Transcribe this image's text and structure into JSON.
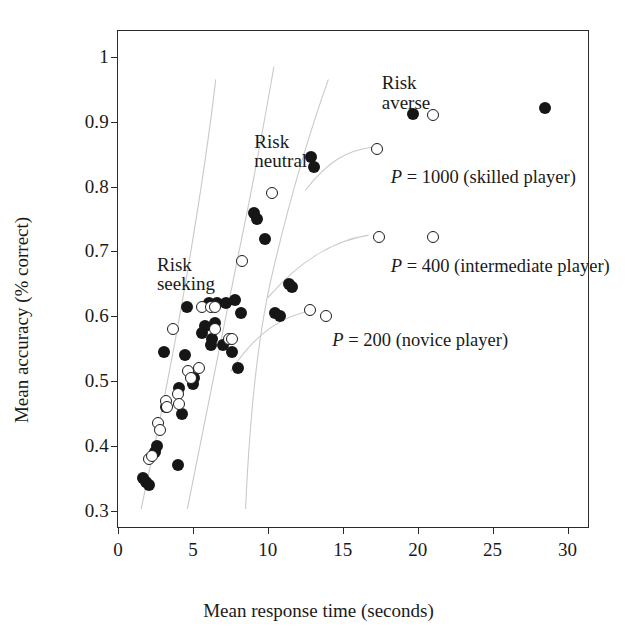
{
  "chart_data": {
    "type": "scatter",
    "title": "",
    "xlabel": "Mean response time (seconds)",
    "ylabel": "Mean accuracy (% correct)",
    "xlim": [
      0,
      31.5
    ],
    "ylim": [
      0.272,
      1.04
    ],
    "xticks": [
      0,
      5,
      10,
      15,
      20,
      25,
      30
    ],
    "xticklabels": [
      "0",
      "5",
      "10",
      "15",
      "20",
      "25",
      "30"
    ],
    "yticks": [
      0.3,
      0.4,
      0.5,
      0.6,
      0.7,
      0.8,
      0.9,
      1.0
    ],
    "yticklabels": [
      "0.3",
      "0.4",
      "0.5",
      "0.6",
      "0.7",
      "0.8",
      "0.9",
      "1"
    ],
    "grid": false,
    "legend": "none",
    "series": [
      {
        "name": "filled-markers",
        "marker": "filled-circle",
        "color": "#161616",
        "points": [
          [
            1.7,
            0.35
          ],
          [
            1.9,
            0.345
          ],
          [
            2.1,
            0.34
          ],
          [
            2.5,
            0.39
          ],
          [
            2.6,
            0.4
          ],
          [
            3.1,
            0.545
          ],
          [
            3.2,
            0.46
          ],
          [
            4.0,
            0.37
          ],
          [
            4.1,
            0.49
          ],
          [
            4.3,
            0.45
          ],
          [
            4.5,
            0.54
          ],
          [
            4.6,
            0.615
          ],
          [
            5.0,
            0.495
          ],
          [
            5.1,
            0.505
          ],
          [
            5.6,
            0.575
          ],
          [
            5.8,
            0.585
          ],
          [
            6.1,
            0.62
          ],
          [
            6.2,
            0.555
          ],
          [
            6.3,
            0.565
          ],
          [
            6.5,
            0.59
          ],
          [
            6.6,
            0.62
          ],
          [
            7.0,
            0.555
          ],
          [
            7.2,
            0.62
          ],
          [
            7.6,
            0.545
          ],
          [
            7.8,
            0.625
          ],
          [
            8.0,
            0.52
          ],
          [
            8.2,
            0.605
          ],
          [
            9.1,
            0.76
          ],
          [
            9.3,
            0.75
          ],
          [
            9.8,
            0.72
          ],
          [
            10.5,
            0.605
          ],
          [
            10.8,
            0.6
          ],
          [
            11.4,
            0.65
          ],
          [
            11.6,
            0.645
          ],
          [
            12.9,
            0.845
          ],
          [
            13.1,
            0.83
          ],
          [
            19.7,
            0.912
          ],
          [
            28.5,
            0.922
          ]
        ]
      },
      {
        "name": "open-markers",
        "marker": "open-circle",
        "color": "#1c1c1c",
        "points": [
          [
            2.1,
            0.38
          ],
          [
            2.3,
            0.385
          ],
          [
            2.7,
            0.435
          ],
          [
            2.8,
            0.425
          ],
          [
            3.2,
            0.47
          ],
          [
            3.3,
            0.46
          ],
          [
            3.7,
            0.58
          ],
          [
            4.0,
            0.48
          ],
          [
            4.1,
            0.465
          ],
          [
            4.7,
            0.515
          ],
          [
            4.9,
            0.505
          ],
          [
            5.4,
            0.52
          ],
          [
            5.6,
            0.615
          ],
          [
            6.2,
            0.615
          ],
          [
            6.5,
            0.615
          ],
          [
            6.5,
            0.58
          ],
          [
            7.4,
            0.565
          ],
          [
            7.6,
            0.565
          ],
          [
            8.3,
            0.685
          ],
          [
            10.3,
            0.79
          ],
          [
            12.8,
            0.61
          ],
          [
            13.9,
            0.6
          ],
          [
            17.4,
            0.722
          ],
          [
            21.0,
            0.722
          ],
          [
            21.0,
            0.911
          ],
          [
            17.3,
            0.858
          ]
        ]
      }
    ],
    "annotations": [
      {
        "name": "risk-seeking",
        "text": "Risk\nseeking",
        "x": 2.6,
        "y": 0.695
      },
      {
        "name": "risk-neutral",
        "text": "Risk\nneutral",
        "x": 9.1,
        "y": 0.885
      },
      {
        "name": "risk-averse",
        "text": "Risk\naverse",
        "x": 17.6,
        "y": 0.975
      },
      {
        "name": "p-1000-label",
        "prefix": "P",
        "text": " = 1000 (skilled player)",
        "x": 18.2,
        "y": 0.828
      },
      {
        "name": "p-400-label",
        "prefix": "P",
        "text": " = 400 (intermediate player)",
        "y": 0.692,
        "x": 18.2
      },
      {
        "name": "p-200-label",
        "prefix": "P",
        "text": " = 200 (novice player)",
        "x": 14.3,
        "y": 0.578
      }
    ],
    "trend_curves": [
      {
        "name": "risk-seeking-boundary",
        "path": "M 1.55 0.300 C 2.50 0.400, 3.55 0.520, 4.45 0.640 C 5.20 0.740, 6.00 0.855, 6.55 0.965"
      },
      {
        "name": "risk-neutral-boundary",
        "path": "M 4.65 0.300 C 5.70 0.420, 7.10 0.585, 8.30 0.720 C 9.20 0.820, 10.00 0.925, 10.45 0.985"
      },
      {
        "name": "risk-averse-boundary",
        "path": "M 8.55 0.300 C 8.80 0.430, 9.30 0.560, 10.30 0.660 C 11.60 0.790, 13.10 0.900, 14.10 0.965"
      },
      {
        "name": "p-200-curve",
        "path": "M 7.55 0.513 C 9.20 0.572, 11.00 0.600, 13.20 0.608"
      },
      {
        "name": "p-400-curve",
        "path": "M 10.05 0.627 C 12.40 0.690, 14.60 0.716, 16.80 0.724"
      },
      {
        "name": "p-1000-curve",
        "path": "M 12.55 0.793 C 14.10 0.840, 15.40 0.855, 17.00 0.860"
      }
    ]
  }
}
